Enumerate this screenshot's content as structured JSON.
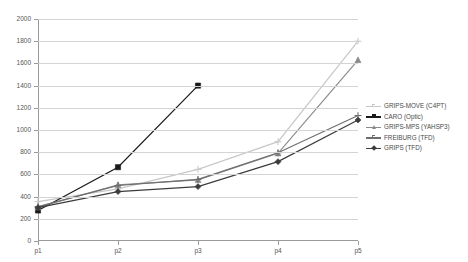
{
  "chart_data": {
    "type": "line",
    "title": "",
    "subtitle": "",
    "xlabel": "",
    "ylabel": "",
    "categories": [
      "p1",
      "p2",
      "p3",
      "p4",
      "p5"
    ],
    "ylim": [
      0,
      2000
    ],
    "ytick_step": 200,
    "yticks": [
      0,
      200,
      400,
      600,
      800,
      1000,
      1200,
      1400,
      1600,
      1800,
      2000
    ],
    "ytick_labels": [
      "0",
      "200",
      "400",
      "600",
      "800",
      "1000",
      "1200",
      "1400",
      "1600",
      "1800",
      "2000"
    ],
    "grid": true,
    "grid_axis": "y",
    "legend_position": "right",
    "markers": true,
    "series": [
      {
        "name": "GRIPS-MOVE (C4PT)",
        "color": "#c8c8c8",
        "marker": "plus",
        "values": [
          355,
          470,
          645,
          895,
          1800
        ]
      },
      {
        "name": "CARO (Optic)",
        "color": "#1a1a1a",
        "marker": "square",
        "values": [
          275,
          665,
          1400,
          null,
          null
        ]
      },
      {
        "name": "GRIPS-MPS (YAHSP3)",
        "color": "#8a8a8a",
        "marker": "triangle",
        "values": [
          305,
          505,
          550,
          790,
          1630
        ]
      },
      {
        "name": "FREIBURG (TFD)",
        "color": "#6e6e6e",
        "marker": "plus",
        "values": [
          310,
          500,
          555,
          795,
          1130
        ]
      },
      {
        "name": "GRIPS (TFD)",
        "color": "#3c3c3c",
        "marker": "diamond",
        "values": [
          300,
          445,
          490,
          715,
          1090
        ]
      }
    ]
  },
  "legend": {
    "items": [
      {
        "label": "GRIPS-MOVE (C4PT)"
      },
      {
        "label": "CARO (Optic)"
      },
      {
        "label": "GRIPS-MPS (YAHSP3)"
      },
      {
        "label": "FREIBURG (TFD)"
      },
      {
        "label": "GRIPS (TFD)"
      }
    ]
  }
}
